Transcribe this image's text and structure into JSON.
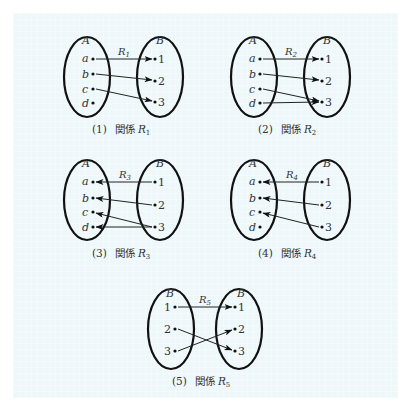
{
  "diagrams": [
    {
      "id": 1,
      "caption_num": "(1)",
      "caption_word": "関係",
      "relation": "R",
      "relation_sub": "1",
      "left_set": "A",
      "right_set": "B",
      "left_elements": [
        "a",
        "b",
        "c",
        "d"
      ],
      "right_elements": [
        "1",
        "2",
        "3"
      ],
      "direction": "left-to-right",
      "mappings": [
        [
          "a",
          "1"
        ],
        [
          "b",
          "2"
        ],
        [
          "c",
          "3"
        ]
      ]
    },
    {
      "id": 2,
      "caption_num": "(2)",
      "caption_word": "関係",
      "relation": "R",
      "relation_sub": "2",
      "left_set": "A",
      "right_set": "B",
      "left_elements": [
        "a",
        "b",
        "c",
        "d"
      ],
      "right_elements": [
        "1",
        "2",
        "3"
      ],
      "direction": "left-to-right",
      "mappings": [
        [
          "a",
          "1"
        ],
        [
          "b",
          "2"
        ],
        [
          "c",
          "3"
        ],
        [
          "d",
          "3"
        ]
      ]
    },
    {
      "id": 3,
      "caption_num": "(3)",
      "caption_word": "関係",
      "relation": "R",
      "relation_sub": "3",
      "left_set": "A",
      "right_set": "B",
      "left_elements": [
        "a",
        "b",
        "c",
        "d"
      ],
      "right_elements": [
        "1",
        "2",
        "3"
      ],
      "direction": "right-to-left",
      "mappings": [
        [
          "1",
          "a"
        ],
        [
          "2",
          "b"
        ],
        [
          "3",
          "c"
        ],
        [
          "3",
          "d"
        ]
      ]
    },
    {
      "id": 4,
      "caption_num": "(4)",
      "caption_word": "関係",
      "relation": "R",
      "relation_sub": "4",
      "left_set": "A",
      "right_set": "B",
      "left_elements": [
        "a",
        "b",
        "c",
        "d"
      ],
      "right_elements": [
        "1",
        "2",
        "3"
      ],
      "direction": "right-to-left",
      "mappings": [
        [
          "1",
          "a"
        ],
        [
          "2",
          "b"
        ],
        [
          "3",
          "c"
        ]
      ]
    },
    {
      "id": 5,
      "caption_num": "(5)",
      "caption_word": "関係",
      "relation": "R",
      "relation_sub": "5",
      "left_set": "B",
      "right_set": "B",
      "left_elements": [
        "1",
        "2",
        "3"
      ],
      "right_elements": [
        "1",
        "2",
        "3"
      ],
      "direction": "left-to-right",
      "mappings": [
        [
          "1",
          "1"
        ],
        [
          "2",
          "3"
        ],
        [
          "3",
          "2"
        ]
      ]
    }
  ]
}
